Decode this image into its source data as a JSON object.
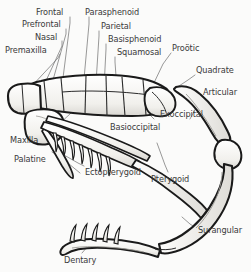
{
  "figure": {
    "background_color": "#fbfbfa",
    "ink_color": "#1a1a1a",
    "label_color": "#3a3a3a",
    "bone_fill": "#f2f1ee",
    "shade_color": "#9a9894",
    "width": 251,
    "height": 272
  },
  "labels": [
    {
      "id": "frontal",
      "text": "Frontal",
      "x": 36,
      "y": 8,
      "align": "left"
    },
    {
      "id": "prefrontal",
      "text": "Prefrontal",
      "x": 22,
      "y": 20,
      "align": "left"
    },
    {
      "id": "nasal",
      "text": "Nasal",
      "x": 35,
      "y": 33,
      "align": "left"
    },
    {
      "id": "premaxilla",
      "text": "Premaxilla",
      "x": 5,
      "y": 46,
      "align": "left"
    },
    {
      "id": "parasphenoid",
      "text": "Parasphenoid",
      "x": 85,
      "y": 8,
      "align": "left"
    },
    {
      "id": "parietal",
      "text": "Parietal",
      "x": 101,
      "y": 22,
      "align": "left"
    },
    {
      "id": "basisphenoid",
      "text": "Basisphenoid",
      "x": 108,
      "y": 35,
      "align": "left"
    },
    {
      "id": "squamosal",
      "text": "Squamosal",
      "x": 117,
      "y": 48,
      "align": "left"
    },
    {
      "id": "prootic",
      "text": "Proötic",
      "x": 172,
      "y": 44,
      "align": "left"
    },
    {
      "id": "quadrate",
      "text": "Quadrate",
      "x": 196,
      "y": 66,
      "align": "left"
    },
    {
      "id": "articular",
      "text": "Articular",
      "x": 203,
      "y": 88,
      "align": "left"
    },
    {
      "id": "exoccipital",
      "text": "Exoccipital",
      "x": 160,
      "y": 110,
      "align": "left"
    },
    {
      "id": "basioccipital",
      "text": "Basioccipital",
      "x": 110,
      "y": 123,
      "align": "left"
    },
    {
      "id": "maxilla",
      "text": "Maxilla",
      "x": 10,
      "y": 136,
      "align": "left"
    },
    {
      "id": "palatine",
      "text": "Palatine",
      "x": 14,
      "y": 155,
      "align": "left"
    },
    {
      "id": "ectopterygoid",
      "text": "Ectopterygoid",
      "x": 85,
      "y": 168,
      "align": "left"
    },
    {
      "id": "pterygoid",
      "text": "Pterygoid",
      "x": 151,
      "y": 175,
      "align": "left"
    },
    {
      "id": "surangular",
      "text": "Surangular",
      "x": 198,
      "y": 226,
      "align": "left"
    },
    {
      "id": "dentary",
      "text": "Dentary",
      "x": 64,
      "y": 256,
      "align": "left"
    }
  ]
}
